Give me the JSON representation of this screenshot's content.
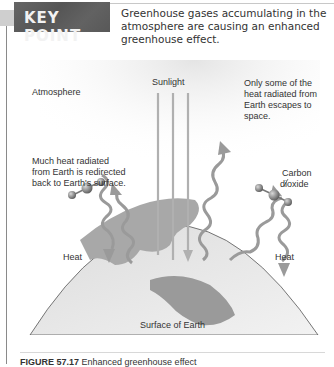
{
  "key_point": {
    "label": "KEY POINT",
    "text": "Greenhouse gases accumulating in the atmosphere are causing an enhanced greenhouse effect.",
    "colors": {
      "banner": "#5c5c5c",
      "banner_text": "#f2f2f2"
    }
  },
  "figure": {
    "labels": {
      "atmosphere": "Atmosphere",
      "sunlight": "Sunlight",
      "escapes_line1": "Only some of the",
      "escapes_line2": "heat radiated from",
      "escapes_line3": "Earth escapes to",
      "escapes_line4": "space.",
      "redirected_line1": "Much heat radiated",
      "redirected_line2": "from Earth is redirected",
      "redirected_line3": "back to Earth's surface.",
      "co2_line1": "Carbon",
      "co2_line2": "dioxide",
      "heat_left": "Heat",
      "heat_right": "Heat",
      "surface": "Surface of Earth"
    }
  },
  "caption": {
    "number": "FIGURE 57.17",
    "text": "Enhanced greenhouse effect"
  }
}
